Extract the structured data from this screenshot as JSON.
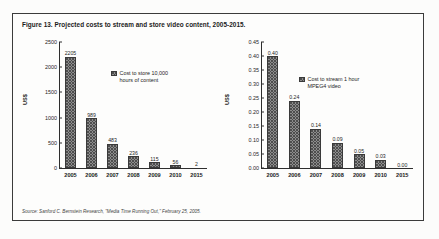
{
  "figure": {
    "title": "Figure 13. Projected costs to stream and store video content, 2005-2015.",
    "source": "Source: Sanford C. Bernstein Research, \"Media Time Running Out,\" February 25, 2005."
  },
  "chart_data": [
    {
      "type": "bar",
      "title": "",
      "xlabel": "",
      "ylabel": "US$",
      "categories": [
        "2005",
        "2006",
        "2007",
        "2008",
        "2009",
        "2010",
        "2015"
      ],
      "values": [
        2205,
        989,
        483,
        236,
        115,
        56,
        2
      ],
      "value_labels": [
        "2205",
        "989",
        "483",
        "236",
        "115",
        "56",
        "2"
      ],
      "ylim": [
        0,
        2500
      ],
      "yticks": [
        0,
        500,
        1000,
        1500,
        2000,
        2500
      ],
      "ytick_labels": [
        "0",
        "500",
        "1000",
        "1500",
        "2000",
        "2500"
      ],
      "grid": false,
      "legend_position": "inside-right",
      "series": [
        {
          "name": "Cost to store 10,000\nhours of content",
          "values": [
            2205,
            989,
            483,
            236,
            115,
            56,
            2
          ]
        }
      ]
    },
    {
      "type": "bar",
      "title": "",
      "xlabel": "",
      "ylabel": "US$",
      "categories": [
        "2005",
        "2006",
        "2007",
        "2008",
        "2009",
        "2010",
        "2015"
      ],
      "values": [
        0.4,
        0.24,
        0.14,
        0.09,
        0.05,
        0.03,
        0.0
      ],
      "value_labels": [
        "0.40",
        "0.24",
        "0.14",
        "0.09",
        "0.05",
        "0.03",
        "0.00"
      ],
      "ylim": [
        0,
        0.45
      ],
      "yticks": [
        0.0,
        0.05,
        0.1,
        0.15,
        0.2,
        0.25,
        0.3,
        0.35,
        0.4,
        0.45
      ],
      "ytick_labels": [
        "0.00",
        "0.05",
        "0.10",
        "0.15",
        "0.20",
        "0.25",
        "0.30",
        "0.35",
        "0.40",
        "0.45"
      ],
      "grid": false,
      "legend_position": "inside-right",
      "series": [
        {
          "name": "Cost to stream 1 hour\nMPEG4 video",
          "values": [
            0.4,
            0.24,
            0.14,
            0.09,
            0.05,
            0.03,
            0.0
          ]
        }
      ]
    }
  ],
  "colors": {
    "bar_fill": "#8d8d8d",
    "bar_outline": "#3a3a3a",
    "axis": "#2e2e2e",
    "frame": "#3b3b3b",
    "page": "#fdfdfc",
    "text": "#1b1b1b"
  }
}
